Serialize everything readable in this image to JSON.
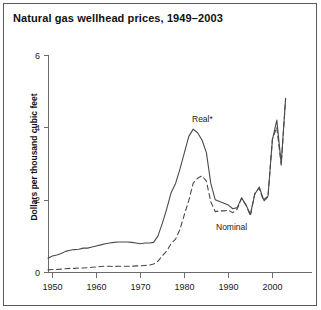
{
  "figure": {
    "title": "Natural gas wellhead prices, 1949–2003",
    "ylabel": "Dollars per thousand cubic feet"
  },
  "annotations": {
    "real": "Real*",
    "nominal": "Nominal"
  },
  "axis": {
    "y_ticks": [
      "0",
      "2",
      "4",
      "6"
    ],
    "x_ticks": [
      "1950",
      "1960",
      "1970",
      "1980",
      "1990",
      "2000"
    ]
  },
  "colors": {
    "line": "#4a4a4a",
    "axis": "#6b6b6b",
    "text": "#111111",
    "border": "#5a5a5a",
    "background": "#ffffff"
  },
  "chart_data": {
    "type": "line",
    "title": "Natural gas wellhead prices, 1949–2003",
    "xlabel": "",
    "ylabel": "Dollars per thousand cubic feet",
    "xlim": [
      1949,
      2003
    ],
    "ylim": [
      0,
      6
    ],
    "grid": false,
    "legend": "inline-annotation",
    "x": [
      1949,
      1950,
      1951,
      1952,
      1953,
      1954,
      1955,
      1956,
      1957,
      1958,
      1959,
      1960,
      1961,
      1962,
      1963,
      1964,
      1965,
      1966,
      1967,
      1968,
      1969,
      1970,
      1971,
      1972,
      1973,
      1974,
      1975,
      1976,
      1977,
      1978,
      1979,
      1980,
      1981,
      1982,
      1983,
      1984,
      1985,
      1986,
      1987,
      1988,
      1989,
      1990,
      1991,
      1992,
      1993,
      1994,
      1995,
      1996,
      1997,
      1998,
      1999,
      2000,
      2001,
      2002,
      2003
    ],
    "series": [
      {
        "name": "Real*",
        "style": "solid",
        "values": [
          0.38,
          0.44,
          0.47,
          0.51,
          0.57,
          0.6,
          0.62,
          0.63,
          0.66,
          0.66,
          0.69,
          0.72,
          0.75,
          0.78,
          0.8,
          0.82,
          0.83,
          0.83,
          0.83,
          0.82,
          0.8,
          0.78,
          0.8,
          0.8,
          0.82,
          1.0,
          1.35,
          1.75,
          2.2,
          2.45,
          2.85,
          3.3,
          3.75,
          3.95,
          3.85,
          3.65,
          3.3,
          2.45,
          2.0,
          1.95,
          1.9,
          1.85,
          1.75,
          1.78,
          2.05,
          1.85,
          1.6,
          2.15,
          2.35,
          2.0,
          2.1,
          3.65,
          4.2,
          3.0,
          4.8
        ]
      },
      {
        "name": "Nominal",
        "style": "dashed",
        "values": [
          0.06,
          0.07,
          0.07,
          0.08,
          0.09,
          0.1,
          0.1,
          0.11,
          0.11,
          0.12,
          0.13,
          0.14,
          0.15,
          0.16,
          0.16,
          0.15,
          0.16,
          0.16,
          0.16,
          0.16,
          0.17,
          0.17,
          0.18,
          0.19,
          0.22,
          0.3,
          0.45,
          0.58,
          0.79,
          0.91,
          1.18,
          1.59,
          1.98,
          2.46,
          2.59,
          2.66,
          2.51,
          1.94,
          1.67,
          1.69,
          1.69,
          1.71,
          1.64,
          1.74,
          2.04,
          1.85,
          1.55,
          2.17,
          2.32,
          1.96,
          2.08,
          3.68,
          4.0,
          2.95,
          4.78
        ]
      }
    ]
  },
  "geometry": {
    "x_origin_px": 48,
    "x_end_px": 312,
    "y_zero_px": 272,
    "y_top_px": 55,
    "px_per_year": 4.4,
    "year_min": 1949,
    "year_max": 2003,
    "value_max": 6
  }
}
